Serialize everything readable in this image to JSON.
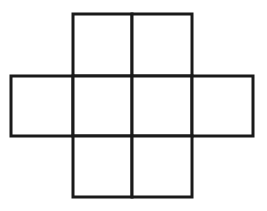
{
  "diagram": {
    "stroke_color": "#1a1a1a",
    "background_color": "#ffffff",
    "stroke_width": 3,
    "grid": {
      "x_edges": [
        11,
        73,
        132,
        192,
        253
      ],
      "y_edges": [
        14,
        76,
        136,
        197
      ]
    },
    "rows": [
      {
        "name": "top-row",
        "cells": [
          {
            "col": 1
          },
          {
            "col": 2
          }
        ]
      },
      {
        "name": "middle-row",
        "cells": [
          {
            "col": 0
          },
          {
            "col": 1
          },
          {
            "col": 2
          },
          {
            "col": 3
          }
        ]
      },
      {
        "name": "bottom-row",
        "cells": [
          {
            "col": 1
          },
          {
            "col": 2
          }
        ]
      }
    ],
    "cell_count": 8
  }
}
